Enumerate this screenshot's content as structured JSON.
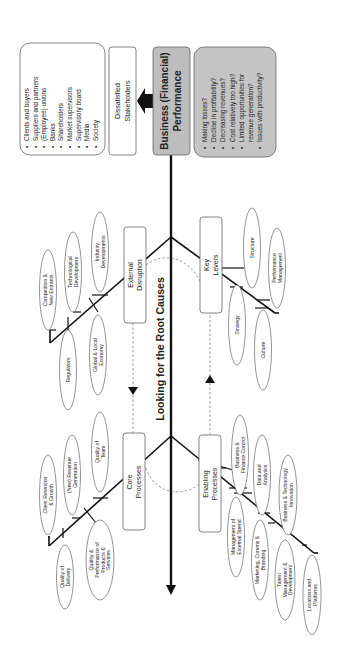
{
  "diagram": {
    "type": "fishbone",
    "orientation": "rotated-90-ccw",
    "spine_label": "Looking for the Root Causes",
    "effect": {
      "title_line1": "Business (Financial)",
      "title_line2": "Performance",
      "fill": "#bdbdbd"
    },
    "issues": {
      "fill": "#c4c4c4",
      "items": [
        "Making losses?",
        "Decline in profitability?",
        "Decreasing revenues?",
        "Cost relatively too high?",
        "Limited opportunities for",
        "revenue generation?",
        "Issues with productivity?"
      ],
      "bullets": [
        true,
        true,
        true,
        true,
        true,
        false,
        true
      ]
    },
    "outcome": {
      "line1": "Dissatisfied",
      "line2": "Stakeholders"
    },
    "stakeholders": {
      "items": [
        "Clients and buyers",
        "Suppliers and partners",
        "(Employee) unions",
        "Banks",
        "Shareholders",
        "Market supervisors",
        "Supervisory board",
        "Media",
        "Society"
      ]
    },
    "categories": {
      "external_disruption": {
        "line1": "External",
        "line2": "Disruption",
        "causes_top": [
          {
            "lines": [
              "Competition &",
              "New Entrants"
            ]
          },
          {
            "lines": [
              "Technological",
              "Development"
            ]
          },
          {
            "lines": [
              "Industry",
              "Developments"
            ]
          }
        ],
        "causes_bottom": [
          {
            "lines": [
              "Regulators"
            ]
          },
          {
            "lines": [
              "Global & Local",
              "Economy"
            ]
          }
        ]
      },
      "key_levers": {
        "line1": "Key",
        "line2": "Levers",
        "causes_top": [
          {
            "lines": [
              "Structure"
            ]
          },
          {
            "lines": [
              "Performance",
              "Management"
            ]
          }
        ],
        "causes_bottom": [
          {
            "lines": [
              "Strategy"
            ]
          },
          {
            "lines": [
              "Culture"
            ]
          }
        ]
      },
      "core_processes": {
        "line1": "Core",
        "line2": "Processes",
        "causes_top": [
          {
            "lines": [
              "Client Retention",
              "& Growth"
            ]
          },
          {
            "lines": [
              "(New) Revenue",
              "Generation"
            ]
          },
          {
            "lines": [
              "Quality of",
              "Team"
            ]
          }
        ],
        "causes_bottom": [
          {
            "lines": [
              "Quality of",
              "Delivery"
            ]
          },
          {
            "lines": [
              "Quality &",
              "Performance of",
              "Products &",
              "Services"
            ]
          }
        ]
      },
      "enabling_processes": {
        "line1": "Enabling",
        "line2": "Processes",
        "causes_top": [
          {
            "lines": [
              "Business &",
              "Finance Control"
            ]
          },
          {
            "lines": [
              "Data and",
              "Analytics"
            ]
          },
          {
            "lines": [
              "Business & Technology",
              "Innovation"
            ]
          }
        ],
        "causes_bottom": [
          {
            "lines": [
              "Management of",
              "External Spend"
            ]
          },
          {
            "lines": [
              "Marketing, Comms &",
              "Branding"
            ]
          },
          {
            "lines": [
              "Talent",
              "Management &",
              "Development"
            ]
          },
          {
            "lines": [
              "Locations and",
              "Platforms"
            ]
          }
        ]
      }
    }
  }
}
